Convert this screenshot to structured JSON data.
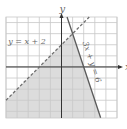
{
  "chart_data": {
    "type": "line",
    "title": "",
    "xlabel": "x",
    "ylabel": "y",
    "xlim": [
      -5,
      5
    ],
    "ylim": [
      -4.6,
      4.5
    ],
    "grid": true,
    "grid_step": 1,
    "series": [
      {
        "name": "y = x + 2",
        "equation": "y = x + 2",
        "slope": 1,
        "intercept": 2,
        "style": "dashed",
        "color": "#6e6e6e"
      },
      {
        "name": "3x + y = 6",
        "equation": "3x + y = 6",
        "slope": -3,
        "intercept": 6,
        "style": "solid",
        "color": "#5a5a5a"
      }
    ],
    "shaded_region": {
      "description": "y < x + 2 and 3x + y <= 6",
      "color": "#dcdcdc"
    },
    "annotations": [
      {
        "text": "y = x + 2",
        "near_series": 0
      },
      {
        "text": "3x + y = 6",
        "near_series": 1
      }
    ]
  },
  "colors": {
    "grid": "#c8c8c8",
    "axis": "#333333",
    "shade": "#dcdcdc",
    "label": "#666666"
  }
}
